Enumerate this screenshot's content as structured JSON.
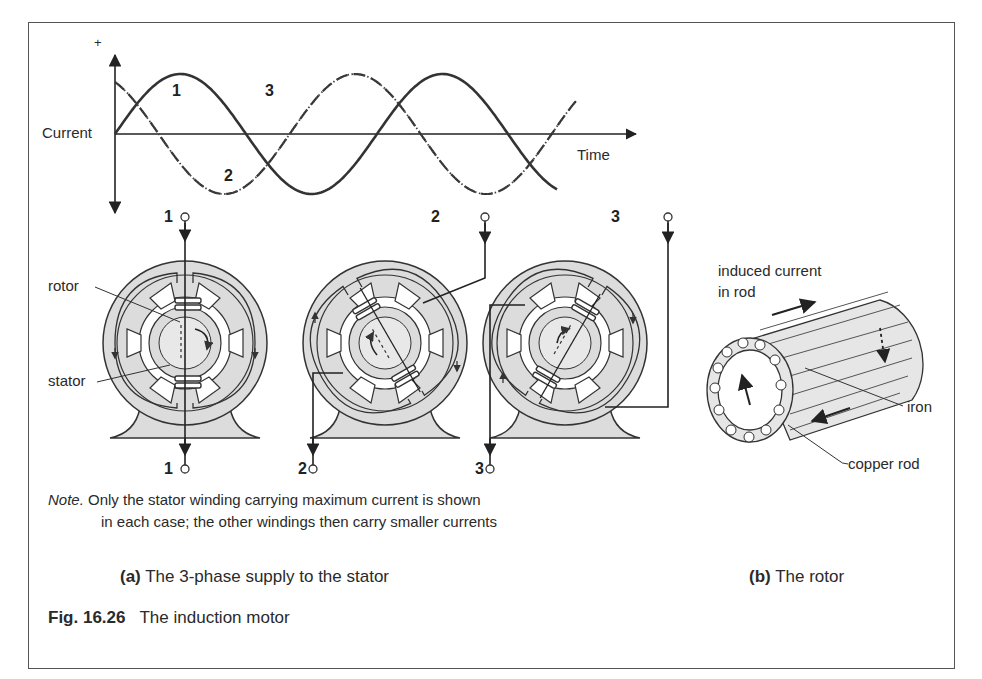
{
  "figure": {
    "number": "Fig. 16.26",
    "title": "The induction motor"
  },
  "graph": {
    "y_axis_label": "Current",
    "y_plus_sign": "+",
    "x_axis_label": "Time",
    "curve_labels": {
      "c1": "1",
      "c2": "2",
      "c3": "3"
    },
    "curves": [
      {
        "id": "1",
        "style": "solid",
        "phase_deg": 0
      },
      {
        "id": "2",
        "style": "dashed",
        "phase_deg": 120
      },
      {
        "id": "3",
        "style": "dotted",
        "phase_deg": 240
      }
    ]
  },
  "motors": [
    {
      "terminal_top": "1",
      "terminal_bottom": "1"
    },
    {
      "terminal_top": "2",
      "terminal_bottom": "2"
    },
    {
      "terminal_top": "3",
      "terminal_bottom": "3"
    }
  ],
  "labels": {
    "rotor": "rotor",
    "stator": "stator",
    "induced_current_line1": "induced current",
    "induced_current_line2": "in rod",
    "iron": "iron",
    "copper_rod": "copper rod"
  },
  "note": {
    "prefix": "Note.",
    "line1": "Only the stator winding carrying maximum current is shown",
    "line2": "in each case; the other windings then carry smaller currents"
  },
  "captions": {
    "a_tag": "(a)",
    "a_text": "The 3-phase supply to the stator",
    "b_tag": "(b)",
    "b_text": "The rotor"
  }
}
